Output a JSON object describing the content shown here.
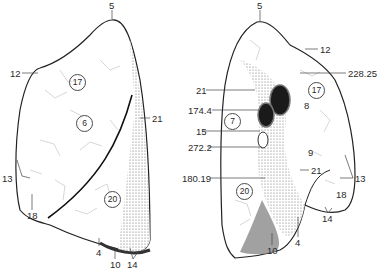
{
  "figure": {
    "colors": {
      "background": "#ffffff",
      "line": "#222222",
      "shade": "#8a8a8a",
      "label": "#2a2a2a"
    }
  },
  "lateral_view": {
    "labels": {
      "apex": "5",
      "anterior_border_upper": "12",
      "fissure": "21",
      "anterior_border_lower": "13",
      "lingula": "18",
      "inferior_border": "4",
      "base": "10",
      "diaphragmatic": "14"
    },
    "circled": {
      "upper": "17",
      "middle": "6",
      "lower": "20"
    }
  },
  "medial_view": {
    "labels": {
      "apex": "5",
      "border_upper": "12",
      "vessel_top": "228.25",
      "fissure_upper": "21",
      "bronchus": "174.4",
      "vein": "15",
      "lymph": "272.2",
      "ligament": "180.19",
      "fissure_lower": "21",
      "cardiac_impression": "8",
      "border_right": "13",
      "lingula": "18",
      "inferior_border": "4",
      "base": "10",
      "diaphragmatic": "14"
    },
    "circled": {
      "upper_right": "17",
      "upper_left": "7",
      "middle": "9",
      "lower": "20"
    }
  }
}
